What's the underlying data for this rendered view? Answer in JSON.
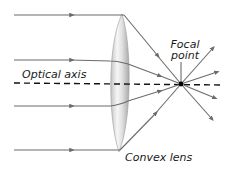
{
  "diagram": {
    "labels": {
      "focal_point_line1": "Focal",
      "focal_point_line2": "point",
      "optical_axis": "Optical axis",
      "convex_lens": "Convex lens"
    },
    "colors": {
      "ray": "#6b6b6b",
      "axis": "#111111",
      "focal_point": "#000000",
      "lens_light": "#f4f4f4",
      "lens_dark": "#b8b8b8",
      "text": "#1a1a1a"
    },
    "incoming_rays": [
      {
        "y": 15
      },
      {
        "y": 60
      },
      {
        "y": 106
      },
      {
        "y": 150
      }
    ],
    "focal_point": {
      "x": 181,
      "y": 84
    },
    "outgoing_rays_count": 4
  }
}
